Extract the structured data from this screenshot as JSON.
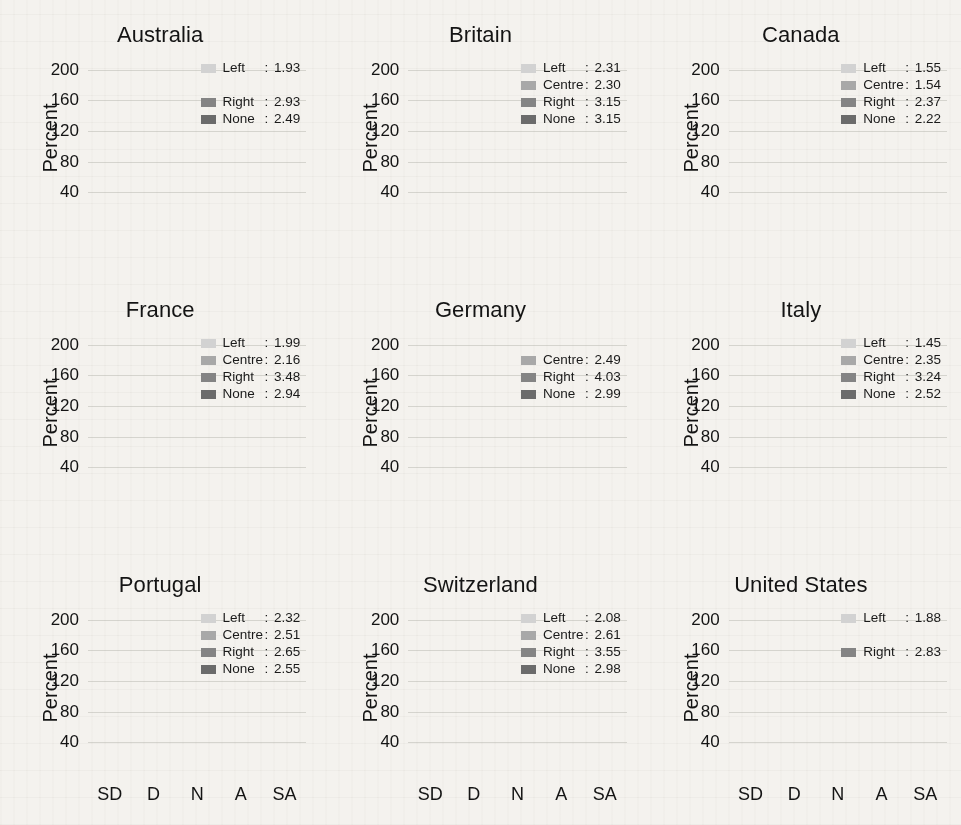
{
  "figure": {
    "ylabel": "Percent",
    "yticks": [
      40,
      80,
      120,
      160,
      200
    ],
    "ylim": [
      0,
      215
    ],
    "xticks": [
      "SD",
      "D",
      "N",
      "A",
      "SA"
    ],
    "x_ticks_shown_on_bottom_row_only": true
  },
  "colors": {
    "Left": "#d2d2d2",
    "Centre": "#a8a8a8",
    "Right": "#848484",
    "None": "#6b6b6b",
    "background": "#f4f2ee",
    "text": "#141414",
    "gridline": "#96948c"
  },
  "chart_data": {
    "type": "bar",
    "subtype": "stacked",
    "title": "",
    "xlabel": "",
    "ylabel": "Percent",
    "categories": [
      "SD",
      "D",
      "N",
      "A",
      "SA"
    ],
    "ylim": [
      0,
      215
    ],
    "yticks": [
      40,
      80,
      120,
      160,
      200
    ],
    "grid": true,
    "legend_position": "top-right inside each panel",
    "series_order": [
      "None",
      "Right",
      "Centre",
      "Left"
    ],
    "panels": [
      {
        "title": "Australia",
        "legend": [
          {
            "name": "Left",
            "value": "1.93"
          },
          {
            "name": "Right",
            "value": "2.93"
          },
          {
            "name": "None",
            "value": "2.49"
          }
        ],
        "legend_layout": [
          "Left",
          "spacer",
          "Right",
          "None"
        ],
        "series": [
          {
            "name": "None",
            "values": [
              0,
              0,
              0,
              0,
              0
            ]
          },
          {
            "name": "Right",
            "values": [
              46,
              63,
              33,
              39,
              31
            ]
          },
          {
            "name": "Centre",
            "values": [
              0,
              0,
              0,
              0,
              0
            ]
          },
          {
            "name": "Left",
            "values": [
              48,
              28,
              14,
              4,
              4
            ]
          }
        ],
        "totals": [
          94,
          91,
          47,
          43,
          35
        ]
      },
      {
        "title": "Britain",
        "legend": [
          {
            "name": "Left",
            "value": "2.31"
          },
          {
            "name": "Centre",
            "value": "2.30"
          },
          {
            "name": "Right",
            "value": "3.15"
          },
          {
            "name": "None",
            "value": "3.15"
          }
        ],
        "legend_layout": [
          "Left",
          "Centre",
          "Right",
          "None"
        ],
        "series": [
          {
            "name": "None",
            "values": [
              27,
              24,
              25,
              21,
              24
            ]
          },
          {
            "name": "Right",
            "values": [
              30,
              30,
              15,
              41,
              15
            ]
          },
          {
            "name": "Centre",
            "values": [
              28,
              22,
              16,
              17,
              6
            ]
          },
          {
            "name": "Left",
            "values": [
              22,
              14,
              12,
              17,
              6
            ]
          }
        ],
        "totals": [
          107,
          90,
          68,
          96,
          51
        ]
      },
      {
        "title": "Canada",
        "legend": [
          {
            "name": "Left",
            "value": "1.55"
          },
          {
            "name": "Centre",
            "value": "1.54"
          },
          {
            "name": "Right",
            "value": "2.37"
          },
          {
            "name": "None",
            "value": "2.22"
          }
        ],
        "legend_layout": [
          "Left",
          "Centre",
          "Right",
          "None"
        ],
        "series": [
          {
            "name": "None",
            "values": [
              41,
              33,
              0,
              0,
              0
            ]
          },
          {
            "name": "Right",
            "values": [
              34,
              29,
              24,
              31,
              19
            ]
          },
          {
            "name": "Centre",
            "values": [
              70,
              19,
              0,
              11,
              0
            ]
          },
          {
            "name": "Left",
            "values": [
              66,
              20,
              0,
              0,
              0
            ]
          }
        ],
        "totals": [
          211,
          101,
          24,
          42,
          19
        ]
      },
      {
        "title": "France",
        "legend": [
          {
            "name": "Left",
            "value": "1.99"
          },
          {
            "name": "Centre",
            "value": "2.16"
          },
          {
            "name": "Right",
            "value": "3.48"
          },
          {
            "name": "None",
            "value": "2.94"
          }
        ],
        "legend_layout": [
          "Left",
          "Centre",
          "Right",
          "None"
        ],
        "series": [
          {
            "name": "None",
            "values": [
              22,
              20,
              18,
              20,
              19
            ]
          },
          {
            "name": "Right",
            "values": [
              20,
              25,
              18,
              36,
              25
            ]
          },
          {
            "name": "Centre",
            "values": [
              28,
              36,
              12,
              8,
              6
            ]
          },
          {
            "name": "Left",
            "values": [
              34,
              35,
              11,
              11,
              4
            ]
          }
        ],
        "totals": [
          104,
          116,
          59,
          75,
          54
        ]
      },
      {
        "title": "Germany",
        "legend": [
          {
            "name": "Centre",
            "value": "2.49"
          },
          {
            "name": "Right",
            "value": "4.03"
          },
          {
            "name": "None",
            "value": "2.99"
          }
        ],
        "legend_layout": [
          "spacer",
          "Centre",
          "Right",
          "None"
        ],
        "series": [
          {
            "name": "None",
            "values": [
              20,
              25,
              22,
              20,
              22
            ]
          },
          {
            "name": "Right",
            "values": [
              0,
              16,
              17,
              27,
              31
            ]
          },
          {
            "name": "Centre",
            "values": [
              25,
              27,
              23,
              16,
              21
            ]
          },
          {
            "name": "Left",
            "values": [
              0,
              0,
              0,
              0,
              0
            ]
          }
        ],
        "totals": [
          45,
          68,
          62,
          63,
          74
        ]
      },
      {
        "title": "Italy",
        "legend": [
          {
            "name": "Left",
            "value": "1.45"
          },
          {
            "name": "Centre",
            "value": "2.35"
          },
          {
            "name": "Right",
            "value": "3.24"
          },
          {
            "name": "None",
            "value": "2.52"
          }
        ],
        "legend_layout": [
          "Left",
          "Centre",
          "Right",
          "None"
        ],
        "series": [
          {
            "name": "None",
            "values": [
              26,
              24,
              22,
              22,
              22
            ]
          },
          {
            "name": "Right",
            "values": [
              15,
              32,
              9,
              24,
              18
            ]
          },
          {
            "name": "Centre",
            "values": [
              33,
              33,
              11,
              16,
              11
            ]
          },
          {
            "name": "Left",
            "values": [
              74,
              19,
              0,
              0,
              0
            ]
          }
        ],
        "totals": [
          148,
          108,
          42,
          62,
          51
        ]
      },
      {
        "title": "Portugal",
        "legend": [
          {
            "name": "Left",
            "value": "2.32"
          },
          {
            "name": "Centre",
            "value": "2.51"
          },
          {
            "name": "Right",
            "value": "2.65"
          },
          {
            "name": "None",
            "value": "2.55"
          }
        ],
        "legend_layout": [
          "Left",
          "Centre",
          "Right",
          "None"
        ],
        "series": [
          {
            "name": "None",
            "values": [
              22,
              51,
              22,
              30,
              28
            ]
          },
          {
            "name": "Right",
            "values": [
              10,
              57,
              22,
              20,
              3
            ]
          },
          {
            "name": "Centre",
            "values": [
              10,
              38,
              0,
              8,
              0
            ]
          },
          {
            "name": "Left",
            "values": [
              20,
              56,
              0,
              9,
              0
            ]
          }
        ],
        "totals": [
          62,
          202,
          44,
          67,
          31
        ]
      },
      {
        "title": "Switzerland",
        "legend": [
          {
            "name": "Left",
            "value": "2.08"
          },
          {
            "name": "Centre",
            "value": "2.61"
          },
          {
            "name": "Right",
            "value": "3.55"
          },
          {
            "name": "None",
            "value": "2.98"
          }
        ],
        "legend_layout": [
          "Left",
          "Centre",
          "Right",
          "None"
        ],
        "series": [
          {
            "name": "None",
            "values": [
              22,
              25,
              22,
              23,
              21
            ]
          },
          {
            "name": "Right",
            "values": [
              18,
              21,
              17,
              40,
              27
            ]
          },
          {
            "name": "Centre",
            "values": [
              32,
              39,
              22,
              13,
              0
            ]
          },
          {
            "name": "Left",
            "values": [
              1,
              30,
              12,
              18,
              0
            ]
          }
        ],
        "totals": [
          73,
          115,
          73,
          94,
          48
        ]
      },
      {
        "title": "United States",
        "legend": [
          {
            "name": "Left",
            "value": "1.88"
          },
          {
            "name": "Right",
            "value": "2.83"
          }
        ],
        "legend_layout": [
          "Left",
          "spacer",
          "Right",
          "spacer"
        ],
        "series": [
          {
            "name": "None",
            "values": [
              0,
              0,
              0,
              0,
              0
            ]
          },
          {
            "name": "Right",
            "values": [
              9,
              37,
              32,
              28,
              6
            ]
          },
          {
            "name": "Centre",
            "values": [
              0,
              0,
              0,
              0,
              0
            ]
          },
          {
            "name": "Left",
            "values": [
              52,
              26,
              16,
              5,
              0
            ]
          }
        ],
        "totals": [
          61,
          63,
          48,
          33,
          6
        ]
      }
    ]
  }
}
